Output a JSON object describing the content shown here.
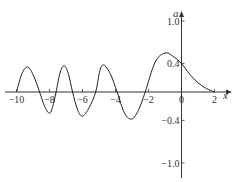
{
  "chart_data": {
    "type": "line",
    "title": "",
    "xlabel": "x",
    "ylabel": "a",
    "xlim": [
      -10,
      2
    ],
    "ylim": [
      -1.0,
      1.0
    ],
    "grid": false,
    "legend": null,
    "x_ticks": [
      -10,
      -8,
      -6,
      -4,
      -2,
      0,
      2
    ],
    "x_tick_labels": [
      "−10",
      "−8",
      "−6",
      "−4",
      "−2",
      "0",
      "2"
    ],
    "y_ticks": [
      1.0,
      0.4,
      -0.4,
      -1.0
    ],
    "y_tick_labels": [
      "1.0",
      "0.4",
      "−0.4",
      "−1.0"
    ],
    "series": [
      {
        "name": "a(x)",
        "x": [
          -10,
          -9.65,
          -9.3,
          -8.95,
          -8.6,
          -8.3,
          -8.0,
          -7.8,
          -7.6,
          -7.35,
          -7.1,
          -6.85,
          -6.6,
          -6.3,
          -6.0,
          -5.6,
          -5.2,
          -4.95,
          -4.7,
          -4.3,
          -3.9,
          -3.45,
          -3.0,
          -2.6,
          -2.2,
          -1.6,
          -1.0,
          -0.5,
          0,
          0.5,
          1.0,
          1.5,
          2.0
        ],
        "y": [
          0,
          0.27,
          0.35,
          0.22,
          0,
          -0.2,
          -0.3,
          -0.2,
          0,
          0.28,
          0.37,
          0.25,
          0,
          -0.25,
          -0.34,
          -0.22,
          0,
          0.3,
          0.38,
          0.25,
          0,
          -0.3,
          -0.38,
          -0.25,
          0,
          0.42,
          0.55,
          0.5,
          0.4,
          0.25,
          0.13,
          0.05,
          0
        ]
      }
    ]
  },
  "labels": {
    "x_axis": "x",
    "y_axis": "a"
  }
}
